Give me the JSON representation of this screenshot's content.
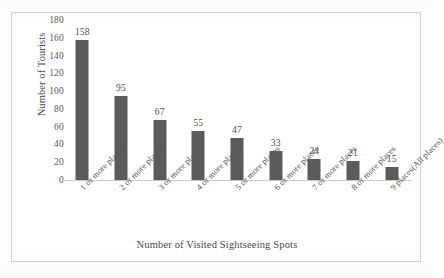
{
  "chart_data": {
    "type": "bar",
    "title": "",
    "xlabel": "Number of Visited Sightseeing Spots",
    "ylabel": "Number of Tourists",
    "categories": [
      "1 or more places",
      "2 or more places",
      "3 or more places",
      "4 or more places",
      "5 or more places",
      "6 or more places",
      "7 or more places",
      "8 or more places",
      "9 places(All places)"
    ],
    "values": [
      158,
      95,
      67,
      55,
      47,
      33,
      24,
      21,
      15
    ],
    "value_labels": [
      "158",
      "95",
      "67",
      "55",
      "47",
      "33",
      "24",
      "21",
      "15"
    ],
    "ylim": [
      0,
      180
    ],
    "ytick_values": [
      0,
      20,
      40,
      60,
      80,
      100,
      120,
      140,
      160,
      180
    ],
    "ytick_labels": [
      "0",
      "20",
      "40",
      "60",
      "80",
      "100",
      "120",
      "140",
      "160",
      "180"
    ],
    "grid": false,
    "legend": null,
    "bar_color": "#5b5b5b",
    "axis_color": "#c8c8c8",
    "text_color": "#4d4d4d",
    "frame_color": "#d0d0d0",
    "background": "#ffffff"
  }
}
